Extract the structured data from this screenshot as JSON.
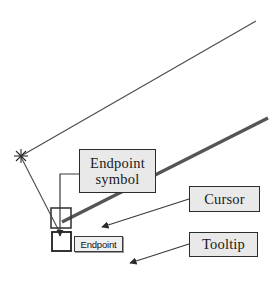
{
  "diagram": {
    "background_color": "#ffffff",
    "callouts": [
      {
        "id": "endpoint-symbol",
        "label": "Endpoint\nsymbol",
        "line1": "Endpoint",
        "line2": "symbol",
        "fill": "#e9e9e9",
        "border": "#2c2c2c"
      },
      {
        "id": "cursor",
        "label": "Cursor",
        "fill": "#e9e9e9",
        "border": "#2c2c2c"
      },
      {
        "id": "tooltip",
        "label": "Tooltip",
        "fill": "#e9e9e9",
        "border": "#2c2c2c"
      }
    ],
    "osnap_tooltip": {
      "label": "Endpoint",
      "fill": "#f0f0f0",
      "border": "#3a3a3a"
    },
    "geometry": {
      "thin_line_color": "#4a4a4a",
      "thick_line_color": "#555555",
      "marker_color": "#2a2a2a",
      "leader_color": "#3a3a3a"
    }
  }
}
